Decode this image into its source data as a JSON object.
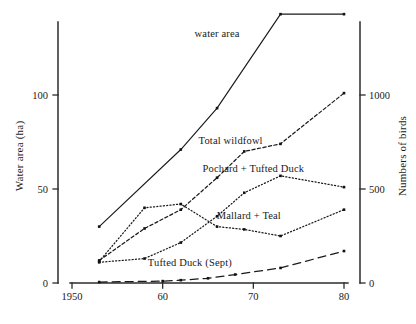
{
  "chart_data": {
    "type": "line",
    "title": "",
    "xlabel": "",
    "ylabel": "Water area (ha)",
    "ylabel_right": "Numbers of birds",
    "xlim": [
      1950,
      1980
    ],
    "ylim": [
      0,
      155
    ],
    "ylim_right": [
      0,
      825
    ],
    "grid": false,
    "legend": "inline-annotations",
    "xticks": [
      1950,
      1960,
      1970,
      1980
    ],
    "xticklabels": [
      "1950",
      "60",
      "70",
      "80"
    ],
    "yticks_left": [
      0,
      50,
      100
    ],
    "yticklabels_left": [
      "0",
      "50",
      "100"
    ],
    "yticks_right": [
      0,
      500,
      1000
    ],
    "yticklabels_right": [
      "0",
      "500",
      "1000"
    ],
    "series": [
      {
        "name": "water area",
        "axis": "left",
        "style": "solid",
        "label_x": 1966,
        "label_y": 133,
        "x": [
          1953,
          1962,
          1966,
          1973,
          1980
        ],
        "values": [
          30,
          71,
          93,
          143,
          143
        ]
      },
      {
        "name": "Total wildfowl",
        "axis": "right",
        "style": "dashed",
        "label_x": 1967.5,
        "label_y_right": 760,
        "x": [
          1953,
          1958,
          1962,
          1966,
          1969,
          1973,
          1980
        ],
        "values": [
          120,
          290,
          390,
          560,
          700,
          740,
          1010
        ]
      },
      {
        "name": "Pochard + Tufted Duck",
        "axis": "right",
        "style": "dotted",
        "label_x": 1970,
        "label_y_right": 610,
        "x": [
          1953,
          1958,
          1962,
          1966,
          1969,
          1973,
          1980
        ],
        "values": [
          110,
          130,
          215,
          355,
          480,
          570,
          510
        ]
      },
      {
        "name": "Mallard + Teal",
        "axis": "right",
        "style": "dotted",
        "label_x": 1969.5,
        "label_y_right": 360,
        "x": [
          1953,
          1958,
          1962,
          1966,
          1969,
          1973,
          1980
        ],
        "values": [
          115,
          400,
          420,
          300,
          285,
          250,
          390
        ]
      },
      {
        "name": "Tufted Duck (Sept)",
        "axis": "right",
        "style": "long-dash",
        "label_x": 1963,
        "label_y_right": 110,
        "x": [
          1953,
          1960,
          1962,
          1965,
          1968,
          1973,
          1980
        ],
        "values": [
          5,
          10,
          15,
          25,
          45,
          80,
          170
        ]
      }
    ]
  }
}
